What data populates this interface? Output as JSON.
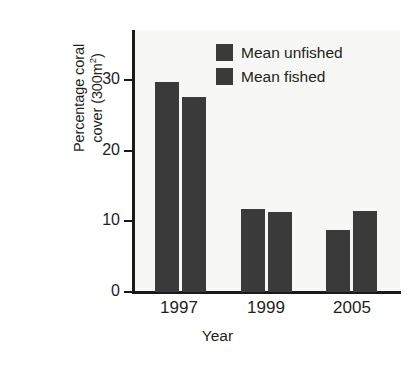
{
  "chart_data": {
    "type": "bar",
    "title": "",
    "subtitle": "",
    "xlabel": "Year",
    "ylabel_line1": "Percentage coral",
    "ylabel_line2_pre": "cover (300m",
    "ylabel_line2_sup": "2",
    "ylabel_line2_post": ")",
    "ylabel_full": "Percentage coral cover (300m2)",
    "categories": [
      "1997",
      "1999",
      "2005"
    ],
    "series": [
      {
        "name": "Mean unfished",
        "values": [
          29.6,
          11.7,
          8.7
        ],
        "color": "#3a3a3a"
      },
      {
        "name": "Mean fished",
        "values": [
          27.6,
          11.3,
          11.4
        ],
        "color": "#3a3a3a"
      }
    ],
    "yticks": [
      "0",
      "10",
      "20",
      "30"
    ],
    "ytick_values": [
      0,
      10,
      20,
      30
    ],
    "ylim": [
      0,
      37
    ],
    "xlim_note": "categorical",
    "grid": false,
    "legend_position": "top-right",
    "legend_entries": [
      "Mean unfished",
      "Mean fished"
    ],
    "plot_background": "#f7f7f5",
    "axis_color": "#1a1a1a",
    "figure_background": "#ffffff"
  },
  "axis": {
    "tick_0": "0",
    "tick_10": "10",
    "tick_20": "20",
    "tick_30": "30",
    "group_1997": "1997",
    "group_1999": "1999",
    "group_2005": "2005",
    "x_title": "Year"
  },
  "legend": {
    "entry_1": "Mean unfished",
    "entry_2": "Mean fished"
  }
}
